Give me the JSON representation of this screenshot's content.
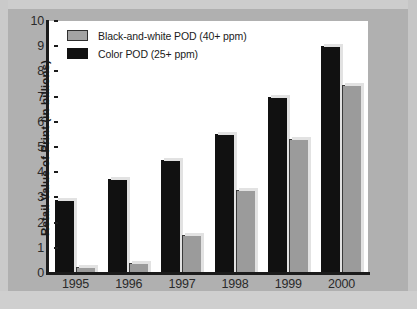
{
  "chart_data": {
    "type": "bar",
    "title": "",
    "subtitle": "",
    "xlabel": "",
    "ylabel": "Retail Value of Print (in billions)",
    "categories": [
      "1995",
      "1996",
      "1997",
      "1998",
      "1999",
      "2000"
    ],
    "ylim": [
      0,
      10
    ],
    "y_ticks": [
      "0",
      "1",
      "2",
      "3",
      "4",
      "5",
      "6",
      "7",
      "8",
      "9",
      "10"
    ],
    "grid": false,
    "legend_position": "top-left",
    "series": [
      {
        "name": "Color POD (25+ ppm)",
        "swatch_icon": "black-square-swatch",
        "color": "#111111",
        "values": [
          2.9,
          3.75,
          4.5,
          5.5,
          7.0,
          9.0
        ]
      },
      {
        "name": "Black-and-white POD (40+ ppm)",
        "swatch_icon": "gray-square-swatch",
        "color": "#9b9b9b",
        "values": [
          0.25,
          0.4,
          1.5,
          3.3,
          5.3,
          7.45
        ]
      }
    ],
    "legend_order": [
      "Black-and-white POD (40+ ppm)",
      "Color POD (25+ ppm)"
    ]
  },
  "legend": {
    "items": [
      {
        "label": "Black-and-white POD (40+ ppm)",
        "swatch": "bw"
      },
      {
        "label": "Color POD (25+ ppm)",
        "swatch": "color"
      }
    ]
  },
  "colors": {
    "page_background": "#b0b0b0",
    "plot_background": "#ffffff",
    "axis": "#1b1b1b",
    "bar_color_pod": "#111111",
    "bar_bw_pod": "#9b9b9b"
  }
}
